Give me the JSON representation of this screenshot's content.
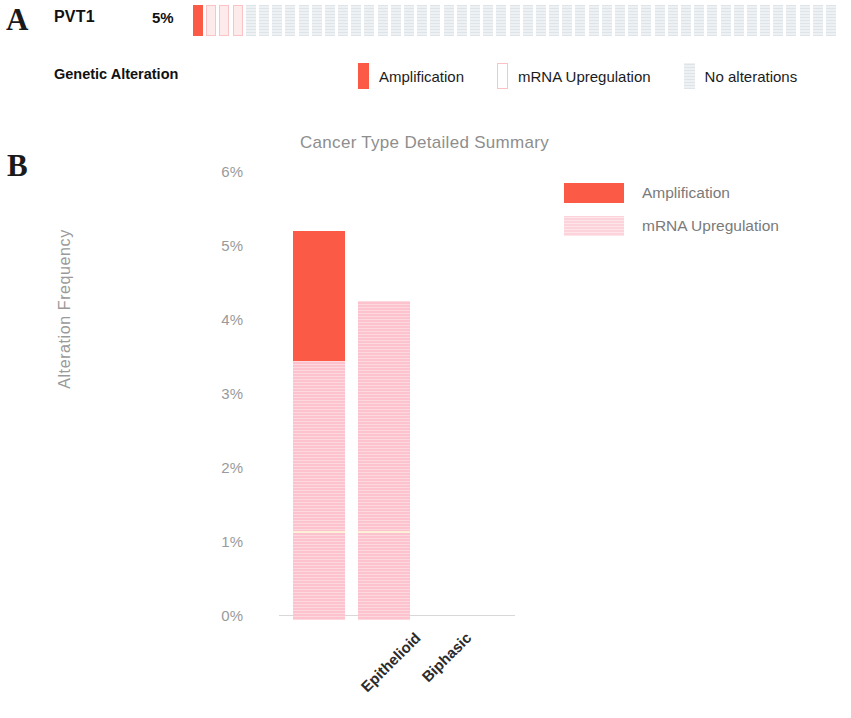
{
  "panels": {
    "a_letter": "A",
    "b_letter": "B"
  },
  "oncoprint": {
    "gene": "PVT1",
    "altered_percent": "5%",
    "row_label": "Genetic Alteration",
    "cells": [
      "amplification",
      "mrna-upregulation",
      "mrna-upregulation",
      "mrna-upregulation",
      "none",
      "none",
      "none",
      "none",
      "none",
      "none",
      "none",
      "none",
      "none",
      "none",
      "none",
      "none",
      "none",
      "none",
      "none",
      "none",
      "none",
      "none",
      "none",
      "none",
      "none",
      "none",
      "none",
      "none",
      "none",
      "none",
      "none",
      "none",
      "none",
      "none",
      "none",
      "none",
      "none",
      "none",
      "none",
      "none",
      "none",
      "none",
      "none",
      "none",
      "none",
      "none",
      "none",
      "none",
      "none"
    ],
    "legend": [
      {
        "swatch": "amplification-swatch",
        "label": "Amplification",
        "color": "#fa5a46"
      },
      {
        "swatch": "mrna-upregulation-swatch",
        "label": "mRNA Upregulation",
        "color": "#fcc3c6"
      },
      {
        "swatch": "no-alterations-swatch",
        "label": "No alterations",
        "color": "#e9ecef"
      }
    ]
  },
  "chart_data": {
    "type": "bar",
    "stacked": true,
    "title": "Cancer Type Detailed Summary",
    "xlabel": "",
    "ylabel": "Alteration Frequency",
    "categories": [
      "Epithelioid",
      "Biphasic"
    ],
    "ylim": [
      0,
      6
    ],
    "yticks": [
      0,
      1,
      2,
      3,
      4,
      5,
      6
    ],
    "ytick_labels": [
      "0%",
      "1%",
      "2%",
      "3%",
      "4%",
      "5%",
      "6%"
    ],
    "grid": false,
    "legend_position": "right",
    "series": [
      {
        "name": "Amplification",
        "color": "#fa5a46",
        "values": [
          1.76,
          0
        ]
      },
      {
        "name": "mRNA Upregulation",
        "color": "#fcc3ce",
        "values": [
          3.5,
          4.31
        ]
      }
    ],
    "totals": [
      5.26,
      4.31
    ]
  }
}
